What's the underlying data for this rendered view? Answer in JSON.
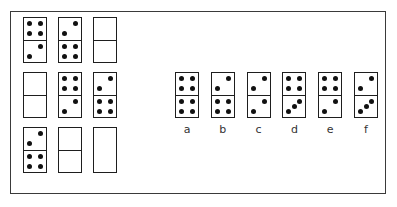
{
  "puzzle": {
    "grid": [
      {
        "id": "r1c1",
        "top": 4,
        "bottom": 2
      },
      {
        "id": "r1c2",
        "top": 2,
        "bottom": 4
      },
      {
        "id": "r1c3",
        "top": 0,
        "bottom": 0
      },
      {
        "id": "r2c1",
        "top": 0,
        "bottom": 0
      },
      {
        "id": "r2c2",
        "top": 4,
        "bottom": 2
      },
      {
        "id": "r2c3",
        "top": 2,
        "bottom": 4
      },
      {
        "id": "r3c1",
        "top": 2,
        "bottom": 4
      },
      {
        "id": "r3c2",
        "top": 0,
        "bottom": 0
      },
      {
        "id": "r3c3",
        "top": null,
        "bottom": null,
        "missing": true
      }
    ],
    "options": [
      {
        "label": "a",
        "top": 4,
        "bottom": 4
      },
      {
        "label": "b",
        "top": 2,
        "bottom": 4
      },
      {
        "label": "c",
        "top": 2,
        "bottom": 2
      },
      {
        "label": "d",
        "top": 4,
        "bottom": 3
      },
      {
        "label": "e",
        "top": 4,
        "bottom": 2
      },
      {
        "label": "f",
        "top": 2,
        "bottom": 3
      }
    ]
  }
}
